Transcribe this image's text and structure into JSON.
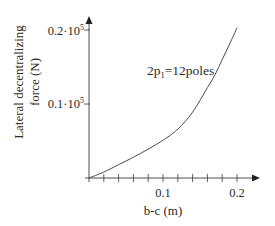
{
  "chart_data": {
    "type": "line",
    "title": "",
    "xlabel": "b-c (m)",
    "ylabel_lines": [
      "Lateral decentralizing",
      "force (N)"
    ],
    "ylabel": "Lateral decentralizing force (N)",
    "xlim": [
      0,
      0.23
    ],
    "ylim": [
      0,
      0.22
    ],
    "y_unit_multiplier": "10^5",
    "grid": false,
    "legend": null,
    "x_ticks": [
      {
        "value": 0.1,
        "label": "0.1"
      },
      {
        "value": 0.2,
        "label": "0.2"
      }
    ],
    "x_minor_ticks": [
      0.02,
      0.04,
      0.06,
      0.08,
      0.1,
      0.12,
      0.14,
      0.16,
      0.18,
      0.2
    ],
    "y_ticks": [
      {
        "value": 0.1,
        "label_main": "0.1·10",
        "label_sup": "5",
        "label": "0.1·10^5"
      },
      {
        "value": 0.2,
        "label_main": "0.2·10",
        "label_sup": "5",
        "label": "0.2·10^5"
      }
    ],
    "annotations": [
      {
        "text_main": "2p",
        "text_sub": "1",
        "text_rest": "=12poles",
        "text": "2p1=12poles",
        "x": 0.08,
        "y": 0.138
      }
    ],
    "series": [
      {
        "name": "2p1=12poles",
        "color": "#4a4a4a",
        "x": [
          0,
          0.02,
          0.04,
          0.06,
          0.08,
          0.1,
          0.12,
          0.14,
          0.16,
          0.17,
          0.18,
          0.19,
          0.2
        ],
        "y": [
          0,
          0.008,
          0.018,
          0.028,
          0.039,
          0.051,
          0.066,
          0.089,
          0.122,
          0.139,
          0.16,
          0.181,
          0.203
        ]
      }
    ]
  },
  "layout": {
    "origin_px": [
      89,
      178
    ],
    "px_per_x_unit": 740,
    "px_per_y_unit": 740,
    "x_axis_end_px": 260,
    "y_axis_top_px": 16,
    "axis_color": "#3a3a3a"
  }
}
